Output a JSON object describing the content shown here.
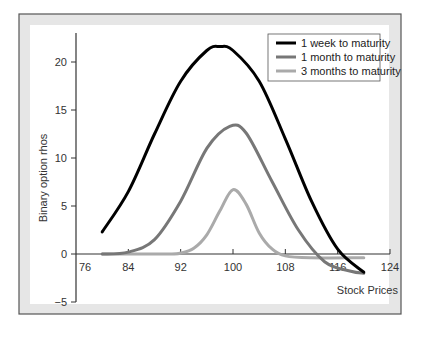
{
  "chart_data": {
    "type": "line",
    "title": "",
    "xlabel": "Stock Prices",
    "ylabel": "Binary option rhos",
    "xlim": [
      76,
      124
    ],
    "ylim": [
      -5,
      23
    ],
    "x_ticks": [
      76,
      84,
      92,
      100,
      108,
      116,
      124
    ],
    "y_ticks": [
      -5,
      0,
      5,
      10,
      15,
      20
    ],
    "x_tick_labels": [
      "76",
      "84",
      "92",
      "100",
      "108",
      "116",
      "124"
    ],
    "y_tick_labels": [
      "−5",
      "0",
      "5",
      "10",
      "15",
      "20"
    ],
    "grid": false,
    "legend_position": "upper right",
    "series": [
      {
        "name": "1 week to maturity",
        "color": "#000000",
        "x": [
          80,
          84,
          88,
          92,
          96,
          98,
          100,
          104,
          108,
          112,
          116,
          120
        ],
        "y": [
          2.3,
          6.5,
          12.5,
          18.0,
          21.2,
          21.6,
          21.2,
          18.0,
          12.0,
          5.5,
          0.5,
          -1.9
        ]
      },
      {
        "name": "1 month to maturity",
        "color": "#777777",
        "x": [
          80,
          84,
          88,
          92,
          96,
          99.5,
          102,
          106,
          110,
          114,
          118,
          120
        ],
        "y": [
          0.0,
          0.2,
          1.5,
          5.5,
          11.0,
          13.3,
          12.6,
          7.5,
          2.5,
          -0.8,
          -1.8,
          -2.0
        ]
      },
      {
        "name": "3 months to maturity",
        "color": "#aaaaaa",
        "x": [
          80,
          90,
          92,
          94,
          96,
          98,
          100,
          102,
          104,
          106,
          108,
          112,
          120
        ],
        "y": [
          0.0,
          0.0,
          0.1,
          0.6,
          2.0,
          4.5,
          6.7,
          5.2,
          2.2,
          0.5,
          -0.2,
          -0.4,
          -0.4
        ]
      }
    ]
  },
  "legend": {
    "items": [
      {
        "label": "1 week to maturity",
        "color": "#000000"
      },
      {
        "label": "1 month to maturity",
        "color": "#777777"
      },
      {
        "label": "3 months to maturity",
        "color": "#aaaaaa"
      }
    ]
  },
  "colors": {
    "frame_border": "#555555",
    "frame_band": "#e6e6e6",
    "plot_bg": "#ffffff",
    "axis": "#333333"
  }
}
